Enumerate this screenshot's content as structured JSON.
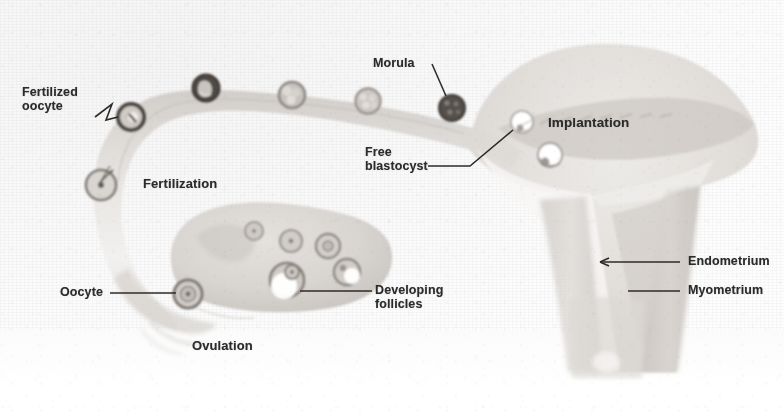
{
  "figure": {
    "background_color": "#fafafa",
    "ink_color": "#2b2b2b",
    "tissue_color": "#d8d5d2"
  },
  "labels": [
    {
      "id": "fertilized-oocyte",
      "text": "Fertilized\noocyte",
      "x": 22,
      "y": 86,
      "size": 12.5,
      "align": "left"
    },
    {
      "id": "fertilization",
      "text": "Fertilization",
      "x": 143,
      "y": 177,
      "size": 13,
      "align": "left"
    },
    {
      "id": "oocyte",
      "text": "Oocyte",
      "x": 60,
      "y": 288,
      "size": 12.5,
      "align": "left"
    },
    {
      "id": "ovulation",
      "text": "Ovulation",
      "x": 192,
      "y": 341,
      "size": 13,
      "align": "left"
    },
    {
      "id": "developing-follicles",
      "text": "Developing\nfollicles",
      "x": 375,
      "y": 286,
      "size": 12.5,
      "align": "left"
    },
    {
      "id": "morula",
      "text": "Morula",
      "x": 373,
      "y": 58,
      "size": 12.5,
      "align": "left"
    },
    {
      "id": "free-blastocyst",
      "text": "Free\nblastocyst",
      "x": 365,
      "y": 148,
      "size": 12.5,
      "align": "left"
    },
    {
      "id": "implantation",
      "text": "Implantation",
      "x": 548,
      "y": 117,
      "size": 13.5,
      "align": "left"
    },
    {
      "id": "endometrium",
      "text": "Endometrium",
      "x": 688,
      "y": 258,
      "size": 12.5,
      "align": "left"
    },
    {
      "id": "myometrium",
      "text": "Myometrium",
      "x": 688,
      "y": 287,
      "size": 12.5,
      "align": "left"
    }
  ],
  "structures": [
    {
      "id": "fallopian-tube",
      "name": "fallopian tube (oviduct)"
    },
    {
      "id": "infundibulum",
      "name": "infundibulum / fimbriae"
    },
    {
      "id": "ovary",
      "name": "ovary"
    },
    {
      "id": "uterus",
      "name": "uterus"
    },
    {
      "id": "endometrium-layer",
      "name": "endometrium"
    },
    {
      "id": "myometrium-layer",
      "name": "myometrium"
    },
    {
      "id": "uterine-cavity",
      "name": "uterine cavity"
    }
  ],
  "embryo_stages": [
    {
      "id": "stage-fertilized-oocyte",
      "name": "fertilized oocyte (zygote)",
      "cx": 131,
      "cy": 117,
      "r": 13,
      "tone": "dark"
    },
    {
      "id": "stage-two-cell",
      "name": "two-cell stage",
      "cx": 206,
      "cy": 88,
      "r": 13.5,
      "tone": "darkest"
    },
    {
      "id": "stage-four-cell",
      "name": "four-cell stage",
      "cx": 292,
      "cy": 95,
      "r": 13,
      "tone": "mid"
    },
    {
      "id": "stage-eight-cell",
      "name": "eight-cell stage",
      "cx": 368,
      "cy": 101,
      "r": 12.5,
      "tone": "light"
    },
    {
      "id": "stage-morula",
      "name": "morula",
      "cx": 452,
      "cy": 108,
      "r": 13,
      "tone": "darkest"
    },
    {
      "id": "stage-free-blastocyst",
      "name": "free blastocyst",
      "cx": 522,
      "cy": 122,
      "r": 11,
      "tone": "white"
    },
    {
      "id": "stage-implanting-blastocyst",
      "name": "implanting blastocyst",
      "cx": 550,
      "cy": 155,
      "r": 12,
      "tone": "white"
    }
  ],
  "ovarian_follicles": [
    {
      "id": "primordial-follicle",
      "name": "primordial follicle",
      "cx": 254,
      "cy": 231,
      "r": 9
    },
    {
      "id": "primary-follicle",
      "name": "primary follicle",
      "cx": 291,
      "cy": 241,
      "r": 11
    },
    {
      "id": "secondary-follicle",
      "name": "secondary follicle",
      "cx": 328,
      "cy": 246,
      "r": 12
    },
    {
      "id": "antral-follicle",
      "name": "antral follicle",
      "cx": 347,
      "cy": 272,
      "r": 13
    },
    {
      "id": "graafian-follicle",
      "name": "graafian follicle",
      "cx": 287,
      "cy": 280,
      "r": 17
    },
    {
      "id": "ruptured-follicle",
      "name": "ruptured follicle / corpus luteum",
      "cx": 188,
      "cy": 294,
      "r": 14
    }
  ],
  "leader_lines": [
    {
      "id": "leader-fertilized-oocyte",
      "from": "fertilized-oocyte",
      "to": "stage-fertilized-oocyte"
    },
    {
      "id": "leader-morula",
      "from": "morula",
      "to": "stage-morula"
    },
    {
      "id": "leader-free-blastocyst",
      "from": "free-blastocyst",
      "to": "stage-free-blastocyst"
    },
    {
      "id": "leader-oocyte",
      "from": "oocyte",
      "to": "ruptured-follicle"
    },
    {
      "id": "leader-developing-follicles",
      "from": "developing-follicles",
      "to": "graafian-follicle"
    },
    {
      "id": "leader-endometrium",
      "from": "endometrium",
      "to": "endometrium-layer",
      "arrow": true
    },
    {
      "id": "leader-myometrium",
      "from": "myometrium",
      "to": "myometrium-layer",
      "arrow": false
    }
  ]
}
